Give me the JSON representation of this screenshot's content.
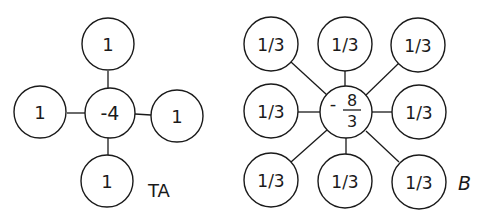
{
  "diagrams": [
    {
      "id": "TA",
      "label": "TA",
      "center": {
        "value": "-4"
      },
      "neighbors": [
        {
          "position": "top",
          "value": "1"
        },
        {
          "position": "left",
          "value": "1"
        },
        {
          "position": "right",
          "value": "1"
        },
        {
          "position": "bottom",
          "value": "1"
        }
      ]
    },
    {
      "id": "B",
      "label": "B",
      "center": {
        "numerator": "8",
        "denominator": "3",
        "sign": "-"
      },
      "neighbors": [
        {
          "position": "top-left",
          "value": "1/3"
        },
        {
          "position": "top",
          "value": "1/3"
        },
        {
          "position": "top-right",
          "value": "1/3"
        },
        {
          "position": "left",
          "value": "1/3"
        },
        {
          "position": "right",
          "value": "1/3"
        },
        {
          "position": "bottom-left",
          "value": "1/3"
        },
        {
          "position": "bottom",
          "value": "1/3"
        },
        {
          "position": "bottom-right",
          "value": "1/3"
        }
      ]
    }
  ]
}
